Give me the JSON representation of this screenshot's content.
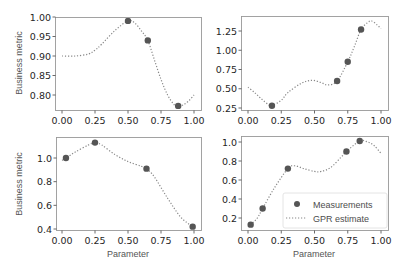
{
  "figure": {
    "legend": {
      "measurements_label": "Measurements",
      "gpr_label": "GPR estimate",
      "position": "lower right of bottom-right panel"
    },
    "colors": {
      "marker": "#555555",
      "line": "#888888",
      "frame": "#999999",
      "tick_text": "#262626"
    }
  },
  "chart_data": [
    {
      "type": "scatter",
      "panel": "top-left",
      "title": "",
      "xlabel": "",
      "ylabel": "Business metric",
      "xlim": [
        -0.05,
        1.05
      ],
      "ylim": [
        0.755,
        1.0
      ],
      "grid": false,
      "xticks": [
        "0.00",
        "0.25",
        "0.50",
        "0.75",
        "1.00"
      ],
      "xtick_values": [
        0.0,
        0.25,
        0.5,
        0.75,
        1.0
      ],
      "yticks": [
        "0.80",
        "0.85",
        "0.90",
        "0.95",
        "1.00"
      ],
      "ytick_values": [
        0.8,
        0.85,
        0.9,
        0.95,
        1.0
      ],
      "series": [
        {
          "name": "Measurements",
          "kind": "scatter",
          "x": [
            0.5,
            0.65,
            0.88
          ],
          "y": [
            0.99,
            0.94,
            0.772
          ]
        },
        {
          "name": "GPR estimate",
          "kind": "line-dotted",
          "x": [
            0.0,
            0.1,
            0.2,
            0.25,
            0.3,
            0.4,
            0.5,
            0.55,
            0.6,
            0.65,
            0.7,
            0.75,
            0.8,
            0.85,
            0.88,
            0.92,
            0.96,
            1.0
          ],
          "y": [
            0.9,
            0.9,
            0.905,
            0.915,
            0.93,
            0.965,
            0.99,
            0.985,
            0.965,
            0.94,
            0.89,
            0.84,
            0.8,
            0.775,
            0.772,
            0.775,
            0.785,
            0.8
          ]
        }
      ]
    },
    {
      "type": "scatter",
      "panel": "top-right",
      "title": "",
      "xlabel": "",
      "ylabel": "",
      "xlim": [
        -0.05,
        1.05
      ],
      "ylim": [
        0.24,
        1.43
      ],
      "grid": false,
      "xticks": [
        "0.00",
        "0.25",
        "0.50",
        "0.75",
        "1.00"
      ],
      "xtick_values": [
        0.0,
        0.25,
        0.5,
        0.75,
        1.0
      ],
      "yticks": [
        "0.25",
        "0.50",
        "0.75",
        "1.00",
        "1.25"
      ],
      "ytick_values": [
        0.25,
        0.5,
        0.75,
        1.0,
        1.25
      ],
      "series": [
        {
          "name": "Measurements",
          "kind": "scatter",
          "x": [
            0.18,
            0.67,
            0.75,
            0.85
          ],
          "y": [
            0.28,
            0.6,
            0.85,
            1.27
          ]
        },
        {
          "name": "GPR estimate",
          "kind": "line-dotted",
          "x": [
            0.0,
            0.05,
            0.1,
            0.15,
            0.18,
            0.25,
            0.3,
            0.4,
            0.48,
            0.55,
            0.6,
            0.67,
            0.75,
            0.8,
            0.85,
            0.9,
            0.93,
            0.97,
            1.0
          ],
          "y": [
            0.52,
            0.45,
            0.37,
            0.3,
            0.28,
            0.35,
            0.45,
            0.57,
            0.61,
            0.58,
            0.55,
            0.6,
            0.85,
            1.05,
            1.27,
            1.36,
            1.38,
            1.33,
            1.28
          ]
        }
      ]
    },
    {
      "type": "scatter",
      "panel": "bottom-left",
      "title": "",
      "xlabel": "Parameter",
      "ylabel": "Business metric",
      "xlim": [
        -0.05,
        1.05
      ],
      "ylim": [
        0.39,
        1.18
      ],
      "grid": false,
      "xticks": [
        "0.00",
        "0.25",
        "0.50",
        "0.75",
        "1.00"
      ],
      "xtick_values": [
        0.0,
        0.25,
        0.5,
        0.75,
        1.0
      ],
      "yticks": [
        "0.4",
        "0.6",
        "0.8",
        "1.0"
      ],
      "ytick_values": [
        0.4,
        0.6,
        0.8,
        1.0
      ],
      "series": [
        {
          "name": "Measurements",
          "kind": "scatter",
          "x": [
            0.03,
            0.25,
            0.64,
            0.99
          ],
          "y": [
            1.0,
            1.13,
            0.91,
            0.42
          ]
        },
        {
          "name": "GPR estimate",
          "kind": "line-dotted",
          "x": [
            0.0,
            0.03,
            0.1,
            0.2,
            0.25,
            0.3,
            0.4,
            0.5,
            0.6,
            0.64,
            0.7,
            0.8,
            0.9,
            0.99
          ],
          "y": [
            0.98,
            1.0,
            1.05,
            1.11,
            1.13,
            1.11,
            1.03,
            0.97,
            0.93,
            0.91,
            0.84,
            0.66,
            0.5,
            0.42
          ]
        }
      ]
    },
    {
      "type": "scatter",
      "panel": "bottom-right",
      "title": "",
      "xlabel": "Parameter",
      "ylabel": "",
      "xlim": [
        -0.05,
        1.05
      ],
      "ylim": [
        0.07,
        1.06
      ],
      "grid": false,
      "legend_position": "lower right",
      "xticks": [
        "0.00",
        "0.25",
        "0.50",
        "0.75",
        "1.00"
      ],
      "xtick_values": [
        0.0,
        0.25,
        0.5,
        0.75,
        1.0
      ],
      "yticks": [
        "0.2",
        "0.4",
        "0.6",
        "0.8",
        "1.0"
      ],
      "ytick_values": [
        0.2,
        0.4,
        0.6,
        0.8,
        1.0
      ],
      "series": [
        {
          "name": "Measurements",
          "kind": "scatter",
          "x": [
            0.02,
            0.11,
            0.3,
            0.74,
            0.84
          ],
          "y": [
            0.13,
            0.3,
            0.72,
            0.9,
            1.01
          ]
        },
        {
          "name": "GPR estimate",
          "kind": "line-dotted",
          "x": [
            0.0,
            0.02,
            0.07,
            0.11,
            0.2,
            0.3,
            0.35,
            0.42,
            0.5,
            0.55,
            0.62,
            0.7,
            0.74,
            0.84,
            0.9,
            0.95,
            1.0
          ],
          "y": [
            0.11,
            0.13,
            0.2,
            0.3,
            0.52,
            0.72,
            0.75,
            0.72,
            0.69,
            0.69,
            0.73,
            0.84,
            0.9,
            1.01,
            1.0,
            0.96,
            0.88
          ]
        }
      ]
    }
  ]
}
